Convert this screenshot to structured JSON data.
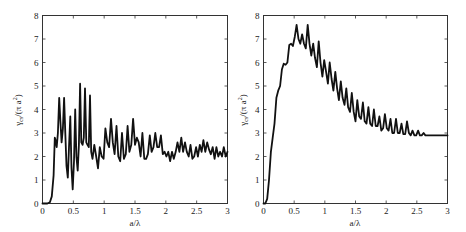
{
  "chart_data": [
    {
      "type": "line",
      "title": "",
      "xlabel": "a/λ",
      "ylabel": "γ_cs/(π a²)",
      "ylabel_main": "γ",
      "ylabel_sub": "cs",
      "ylabel_tail": "/(π a",
      "ylabel_sup": "2",
      "ylabel_close": ")",
      "xlim": [
        0,
        3
      ],
      "ylim": [
        0,
        8
      ],
      "grid": false,
      "legend": null,
      "xticks": [
        0,
        0.5,
        1,
        1.5,
        2,
        2.5,
        3
      ],
      "xtick_labels": [
        "0",
        "0.5",
        "1",
        "1.5",
        "2",
        "2.5",
        "3"
      ],
      "yticks": [
        0,
        1,
        2,
        3,
        4,
        5,
        6,
        7,
        8
      ],
      "ytick_labels": [
        "0",
        "1",
        "2",
        "3",
        "4",
        "5",
        "6",
        "7",
        "8"
      ],
      "series": [
        {
          "name": "left",
          "x": [
            0,
            0.08,
            0.12,
            0.15,
            0.18,
            0.2,
            0.21,
            0.23,
            0.25,
            0.27,
            0.29,
            0.31,
            0.33,
            0.35,
            0.37,
            0.39,
            0.41,
            0.43,
            0.45,
            0.47,
            0.49,
            0.51,
            0.53,
            0.55,
            0.57,
            0.59,
            0.61,
            0.63,
            0.65,
            0.67,
            0.69,
            0.71,
            0.73,
            0.75,
            0.77,
            0.79,
            0.81,
            0.84,
            0.87,
            0.9,
            0.93,
            0.96,
            0.99,
            1.02,
            1.05,
            1.08,
            1.11,
            1.14,
            1.17,
            1.2,
            1.23,
            1.26,
            1.29,
            1.32,
            1.35,
            1.38,
            1.41,
            1.44,
            1.47,
            1.5,
            1.53,
            1.56,
            1.59,
            1.62,
            1.65,
            1.68,
            1.71,
            1.74,
            1.77,
            1.8,
            1.83,
            1.86,
            1.89,
            1.92,
            1.95,
            1.98,
            2.01,
            2.04,
            2.07,
            2.1,
            2.13,
            2.16,
            2.19,
            2.22,
            2.25,
            2.28,
            2.31,
            2.34,
            2.37,
            2.4,
            2.43,
            2.46,
            2.49,
            2.52,
            2.55,
            2.58,
            2.61,
            2.64,
            2.67,
            2.7,
            2.73,
            2.76,
            2.79,
            2.82,
            2.85,
            2.88,
            2.91,
            2.94,
            2.97,
            3.0
          ],
          "y": [
            0,
            0,
            0.05,
            0.3,
            1.2,
            2.8,
            2.7,
            2.4,
            3.0,
            4.5,
            3.5,
            2.6,
            3.2,
            4.5,
            3.0,
            1.6,
            1.1,
            2.4,
            3.7,
            1.5,
            0.6,
            1.8,
            4.0,
            2.0,
            1.4,
            2.5,
            5.1,
            2.6,
            2.5,
            2.8,
            4.9,
            2.6,
            2.5,
            2.4,
            4.6,
            2.2,
            1.9,
            2.5,
            2.0,
            1.5,
            2.4,
            2.0,
            1.9,
            3.2,
            2.6,
            2.4,
            3.6,
            2.6,
            2.1,
            3.3,
            2.0,
            1.8,
            3.0,
            1.9,
            2.1,
            3.3,
            2.2,
            2.5,
            3.6,
            2.5,
            2.8,
            2.6,
            2.0,
            3.0,
            1.9,
            1.9,
            2.1,
            2.9,
            2.2,
            2.4,
            3.0,
            2.4,
            2.4,
            2.9,
            2.1,
            2.2,
            2.0,
            2.2,
            1.8,
            2.2,
            1.9,
            2.2,
            2.6,
            2.2,
            2.8,
            2.2,
            2.6,
            2.2,
            2.0,
            2.5,
            1.9,
            2.0,
            2.4,
            2.0,
            2.5,
            2.2,
            2.7,
            2.2,
            2.6,
            2.3,
            2.1,
            2.4,
            1.9,
            2.4,
            2.0,
            2.2,
            2.0,
            2.4,
            2.0,
            2.2
          ]
        },
        {
          "name": "right",
          "x": [
            0,
            0.03,
            0.06,
            0.09,
            0.12,
            0.15,
            0.18,
            0.21,
            0.24,
            0.27,
            0.3,
            0.33,
            0.36,
            0.39,
            0.42,
            0.45,
            0.48,
            0.51,
            0.54,
            0.57,
            0.6,
            0.63,
            0.66,
            0.69,
            0.72,
            0.75,
            0.78,
            0.81,
            0.84,
            0.87,
            0.9,
            0.93,
            0.96,
            0.99,
            1.02,
            1.05,
            1.08,
            1.11,
            1.14,
            1.17,
            1.2,
            1.23,
            1.26,
            1.29,
            1.32,
            1.35,
            1.38,
            1.41,
            1.44,
            1.47,
            1.5,
            1.53,
            1.56,
            1.59,
            1.62,
            1.65,
            1.68,
            1.71,
            1.74,
            1.77,
            1.8,
            1.83,
            1.86,
            1.89,
            1.92,
            1.95,
            1.98,
            2.01,
            2.04,
            2.07,
            2.1,
            2.13,
            2.16,
            2.19,
            2.22,
            2.25,
            2.28,
            2.31,
            2.34,
            2.37,
            2.4,
            2.43,
            2.46,
            2.49,
            2.52,
            2.55,
            2.58,
            2.61,
            2.64,
            2.67,
            2.7,
            2.73,
            2.76,
            2.79,
            2.82,
            2.85,
            2.88,
            2.91,
            2.94,
            2.97,
            3.0
          ],
          "y": [
            0,
            0,
            0.2,
            1.0,
            2.2,
            2.8,
            3.4,
            4.5,
            4.8,
            5.0,
            5.7,
            5.95,
            5.9,
            6.0,
            6.75,
            6.8,
            6.7,
            7.1,
            7.6,
            7.0,
            6.8,
            7.2,
            6.8,
            6.6,
            7.6,
            6.8,
            6.3,
            6.8,
            6.2,
            5.8,
            6.9,
            6.0,
            5.4,
            6.1,
            5.6,
            5.1,
            6.0,
            5.3,
            4.8,
            5.6,
            4.9,
            4.4,
            5.2,
            4.5,
            4.2,
            4.9,
            4.1,
            3.9,
            4.7,
            3.9,
            3.5,
            4.4,
            3.7,
            3.6,
            4.3,
            3.5,
            3.4,
            4.1,
            3.4,
            3.3,
            4.0,
            3.3,
            3.3,
            3.7,
            3.1,
            3.2,
            3.8,
            3.2,
            3.1,
            3.6,
            3.0,
            3.0,
            3.6,
            3.0,
            3.0,
            3.4,
            2.95,
            2.95,
            3.5,
            3.0,
            2.9,
            3.1,
            2.9,
            2.9,
            3.1,
            2.9,
            2.9,
            3.0,
            2.9,
            2.9,
            2.9,
            2.9,
            2.9,
            2.9,
            2.9,
            2.9,
            2.9,
            2.9,
            2.9,
            2.9,
            2.9
          ]
        }
      ]
    }
  ],
  "panels": [
    {
      "id": "left",
      "xlabel": "a/λ"
    },
    {
      "id": "right",
      "xlabel": "a/λ"
    }
  ],
  "style": {
    "line_color": "#111111",
    "frame_color": "#333333",
    "background": "#ffffff"
  }
}
